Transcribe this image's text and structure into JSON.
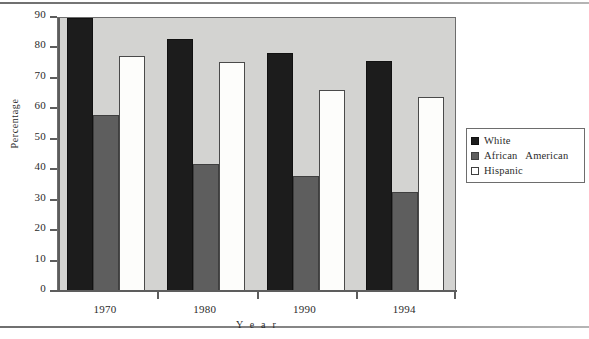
{
  "chart_data": {
    "type": "bar",
    "title": "",
    "xlabel": "Year",
    "ylabel": "Percentage",
    "categories": [
      "1970",
      "1980",
      "1990",
      "1994"
    ],
    "series": [
      {
        "name": "White",
        "color": "#1c1c1c",
        "values": [
          90,
          83,
          78.5,
          76
        ]
      },
      {
        "name": "African   American",
        "color": "#5e5e5e",
        "values": [
          58,
          42,
          38,
          33
        ]
      },
      {
        "name": "Hispanic",
        "color": "#ffffff",
        "values": [
          77.5,
          75.5,
          66.5,
          64
        ]
      }
    ],
    "ylim": [
      0,
      90
    ],
    "ytick_values": [
      0,
      10,
      20,
      30,
      40,
      50,
      60,
      70,
      80,
      90
    ],
    "ytick_labels": [
      "0",
      "10",
      "20",
      "30",
      "40",
      "50",
      "60",
      "70",
      "80",
      "90"
    ],
    "grid": false,
    "legend_position": "right"
  },
  "axes": {
    "y_title": "Percentage",
    "x_title": "Y e a r"
  },
  "legend": {
    "items": [
      {
        "label": "White",
        "swatch": "black-square-swatch"
      },
      {
        "label": "African   American",
        "swatch": "gray-square-swatch"
      },
      {
        "label": "Hispanic",
        "swatch": "white-square-swatch"
      }
    ]
  }
}
